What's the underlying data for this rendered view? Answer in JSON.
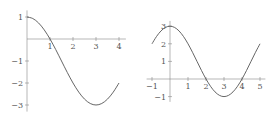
{
  "colors": {
    "curve": "#555555",
    "axis": "#888888",
    "tick_label": "#555555"
  },
  "chart_data": [
    {
      "type": "line",
      "title": "",
      "xlabel": "",
      "ylabel": "",
      "xlim": [
        0,
        4.3
      ],
      "ylim": [
        -3.3,
        1.3
      ],
      "grid": false,
      "legend": null,
      "xticks": [
        1,
        2,
        3,
        4
      ],
      "xtick_labels": [
        "1",
        "2",
        "3",
        "4"
      ],
      "yticks": [
        1,
        -1,
        -2,
        -3
      ],
      "ytick_labels": [
        "1",
        "−1",
        "−2",
        "−3"
      ],
      "series": [
        {
          "name": "y = -1 + 2cos(πx/3)",
          "x": [
            0,
            0.25,
            0.5,
            0.75,
            1,
            1.25,
            1.5,
            1.75,
            2,
            2.25,
            2.5,
            2.75,
            3,
            3.25,
            3.5,
            3.75,
            4
          ],
          "y": [
            1,
            0.932,
            0.732,
            0.414,
            0,
            -0.482,
            -1,
            -1.518,
            -2,
            -2.414,
            -2.732,
            -2.932,
            -3,
            -2.932,
            -2.732,
            -2.414,
            -2
          ]
        }
      ]
    },
    {
      "type": "line",
      "title": "",
      "xlabel": "",
      "ylabel": "",
      "xlim": [
        -1.3,
        5.3
      ],
      "ylim": [
        -1.3,
        3.3
      ],
      "grid": false,
      "legend": null,
      "xticks": [
        -1,
        1,
        2,
        3,
        4,
        5
      ],
      "xtick_labels": [
        "−1",
        "1",
        "2",
        "3",
        "4",
        "5"
      ],
      "yticks": [
        3,
        2,
        1,
        -1
      ],
      "ytick_labels": [
        "3",
        "2",
        "1",
        "−1"
      ],
      "series": [
        {
          "name": "y = 1 + 2cos(πx/3)",
          "x": [
            -1,
            -0.75,
            -0.5,
            -0.25,
            0,
            0.25,
            0.5,
            0.75,
            1,
            1.25,
            1.5,
            1.75,
            2,
            2.25,
            2.5,
            2.75,
            3,
            3.25,
            3.5,
            3.75,
            4,
            4.25,
            4.5,
            4.75,
            5
          ],
          "y": [
            2,
            2.414,
            2.732,
            2.932,
            3,
            2.932,
            2.732,
            2.414,
            2,
            1.518,
            1,
            0.482,
            0,
            -0.414,
            -0.732,
            -0.932,
            -1,
            -0.932,
            -0.732,
            -0.414,
            0,
            0.482,
            1,
            1.518,
            2
          ]
        }
      ]
    }
  ],
  "layout": [
    {
      "left": 0,
      "width": 138,
      "origin_px": [
        27,
        39
      ],
      "unit_px": [
        23,
        22
      ]
    },
    {
      "left": 138,
      "width": 138,
      "origin_px": [
        32,
        79
      ],
      "unit_px": [
        18,
        17.6
      ]
    }
  ]
}
